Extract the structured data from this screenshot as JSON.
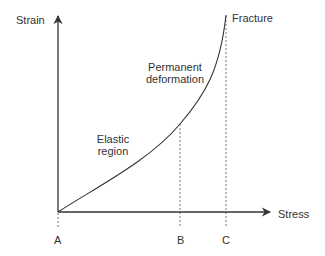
{
  "diagram": {
    "type": "stress-strain curve",
    "axes": {
      "y_label": "Strain",
      "x_label": "Stress"
    },
    "regions": {
      "elastic": [
        "Elastic",
        "region"
      ],
      "permanent": [
        "Permanent",
        "deformation"
      ]
    },
    "points": {
      "fracture": "Fracture",
      "a": "A",
      "b": "B",
      "c": "C"
    },
    "colors": {
      "line": "#333333",
      "dashed": "#777777",
      "text": "#333333",
      "background": "#ffffff"
    }
  }
}
